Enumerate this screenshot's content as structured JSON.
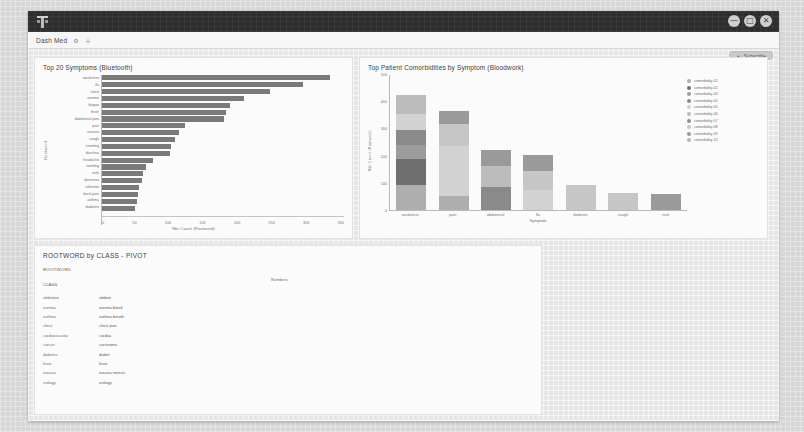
{
  "window": {
    "logo_icon": "tableau-logo-icon",
    "controls": [
      {
        "name": "minimize-button",
        "glyph": "—"
      },
      {
        "name": "maximize-button",
        "glyph": "□"
      },
      {
        "name": "close-button",
        "glyph": "✕"
      }
    ]
  },
  "tabstrip": {
    "tab_label": "Dash Med",
    "icons": [
      {
        "name": "settings-icon",
        "glyph": "⚙"
      },
      {
        "name": "add-tab-icon",
        "glyph": "＋"
      }
    ]
  },
  "toolbar": {
    "share_icon": "share-icon",
    "share_label": "Subscribe"
  },
  "chart_data": [
    {
      "type": "bar",
      "orientation": "horizontal",
      "title": "Top 20 Symptoms (Bluetooth)",
      "xlabel": "Nbr Count (Rootword)",
      "ylabel": "Rootword",
      "xlim": [
        0,
        350
      ],
      "xticks": [
        0,
        50,
        100,
        150,
        200,
        250,
        300,
        350
      ],
      "grid": false,
      "bar_color": "#7a7a7a",
      "categories": [
        "weakness",
        "flu",
        "chest",
        "anemia",
        "fatigue",
        "fever",
        "abdominal pain",
        "pain",
        "nausea",
        "cough",
        "vomiting",
        "diarrhea",
        "headache",
        "swelling",
        "rash",
        "dizziness",
        "infection",
        "back pain",
        "asthma",
        "diabetes"
      ],
      "values": [
        330,
        290,
        243,
        205,
        185,
        180,
        176,
        120,
        112,
        106,
        100,
        98,
        74,
        64,
        60,
        58,
        54,
        52,
        50,
        48
      ]
    },
    {
      "type": "bar",
      "orientation": "vertical",
      "stacked": true,
      "title": "Top Patient Comorbidities by Symptom (Bloodwork)",
      "xlabel": "Symptom",
      "ylabel": "Nbr Count (Rootword)",
      "ylim": [
        0,
        500
      ],
      "yticks": [
        0,
        100,
        200,
        300,
        400,
        500
      ],
      "legend_position": "right",
      "categories": [
        "weakness",
        "pain",
        "abdominal",
        "flu",
        "diabetes",
        "cough",
        "rash"
      ],
      "series": [
        {
          "name": "comorbidity-01",
          "color": "#aeaeae",
          "values": [
            92,
            52,
            0,
            0,
            0,
            0,
            0
          ]
        },
        {
          "name": "comorbidity-02",
          "color": "#6f6f6f",
          "values": [
            96,
            0,
            0,
            0,
            0,
            0,
            0
          ]
        },
        {
          "name": "comorbidity-03",
          "color": "#9c9c9c",
          "values": [
            50,
            0,
            0,
            0,
            0,
            0,
            0
          ]
        },
        {
          "name": "comorbidity-04",
          "color": "#8a8a8a",
          "values": [
            56,
            0,
            86,
            0,
            0,
            0,
            0
          ]
        },
        {
          "name": "comorbidity-05",
          "color": "#d2d2d2",
          "values": [
            60,
            182,
            0,
            72,
            0,
            0,
            0
          ]
        },
        {
          "name": "comorbidity-06",
          "color": "#bcbcbc",
          "values": [
            70,
            0,
            76,
            0,
            0,
            0,
            0
          ]
        },
        {
          "name": "comorbidity-07",
          "color": "#8f8f8f",
          "values": [
            0,
            0,
            0,
            0,
            0,
            0,
            0
          ]
        },
        {
          "name": "comorbidity-08",
          "color": "#c6c6c6",
          "values": [
            0,
            82,
            0,
            70,
            92,
            62,
            0
          ]
        },
        {
          "name": "comorbidity-09",
          "color": "#9a9a9a",
          "values": [
            0,
            48,
            58,
            62,
            0,
            0,
            60
          ]
        },
        {
          "name": "comorbidity-10",
          "color": "#b4b4b4",
          "values": [
            0,
            0,
            0,
            0,
            0,
            0,
            0
          ]
        }
      ],
      "legend_entries": [
        "comorbidity-01",
        "comorbidity-02",
        "comorbidity-03",
        "comorbidity-04",
        "comorbidity-05",
        "comorbidity-06",
        "comorbidity-07",
        "comorbidity-08",
        "comorbidity-09",
        "comorbidity-10"
      ]
    }
  ],
  "pivot": {
    "title": "ROOTWORD by CLASS - PIVOT",
    "field_label": "ROOTWORD",
    "class_label": "CLASS",
    "measure_label": "Numbers",
    "columns": [
      "CLASS",
      "ROOTWORD"
    ],
    "rows": [
      {
        "class": "abdomen",
        "rootword": "abdom"
      },
      {
        "class": "anemia",
        "rootword": "anemia blood"
      },
      {
        "class": "asthma",
        "rootword": "asthma breath"
      },
      {
        "class": "chest",
        "rootword": "chest pain"
      },
      {
        "class": "cardiovascular",
        "rootword": "cardiac"
      },
      {
        "class": "cancer",
        "rootword": "carcinoma"
      },
      {
        "class": "diabetes",
        "rootword": "diabet"
      },
      {
        "class": "fever",
        "rootword": "fever"
      },
      {
        "class": "nausea",
        "rootword": "nausea emesis"
      },
      {
        "class": "urology",
        "rootword": "urology"
      }
    ]
  }
}
